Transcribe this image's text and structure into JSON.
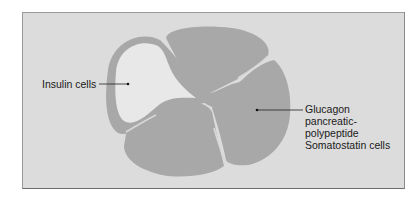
{
  "figure": {
    "type": "pancreatic islet cross-section schematic",
    "colors": {
      "page_background": "#ffffff",
      "frame_background": "#dcdcdc",
      "frame_border": "#7a7a7a",
      "lobe_fill": "#a8a8a8",
      "insulin_region_fill": "#e8e8e8",
      "gap_highlight": "#d4d4d4",
      "label_text": "#1a1a1a",
      "leader_line": "#222222"
    }
  },
  "labels": {
    "insulin": {
      "text": "Insulin cells",
      "pointer_target": "light inner region (left)"
    },
    "glucagon": {
      "lines": [
        "Glucagon",
        "pancreatic-",
        "polypeptide",
        "Somatostatin cells"
      ],
      "pointer_target": "dark lobes (right)"
    }
  }
}
